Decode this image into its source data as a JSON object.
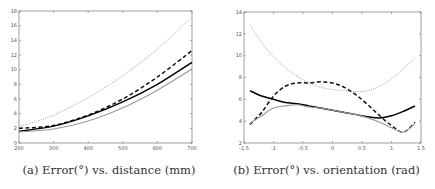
{
  "chart_data": [
    {
      "type": "line",
      "title": "",
      "caption": "(a) Error(°) vs. distance (mm)",
      "xlabel": "",
      "ylabel": "",
      "xlim": [
        200,
        700
      ],
      "ylim": [
        0,
        18
      ],
      "xticks": [
        200,
        300,
        400,
        500,
        600,
        700
      ],
      "yticks": [
        0,
        2,
        4,
        6,
        8,
        10,
        12,
        14,
        16,
        18
      ],
      "grid": false,
      "legend": null,
      "x": [
        200,
        300,
        400,
        500,
        600,
        700
      ],
      "series": [
        {
          "name": "dotted-gray",
          "style": "dotted",
          "color": "#888888",
          "values": [
            2.2,
            3.8,
            6.2,
            9.2,
            12.8,
            17.2
          ]
        },
        {
          "name": "dashed-black",
          "style": "dashed",
          "color": "#111111",
          "values": [
            2.0,
            2.4,
            3.8,
            6.0,
            9.0,
            12.6
          ]
        },
        {
          "name": "solid-black",
          "style": "solid",
          "color": "#000000",
          "values": [
            1.6,
            2.3,
            3.7,
            5.6,
            8.0,
            11.0
          ]
        },
        {
          "name": "solid-gray",
          "style": "solid",
          "color": "#999999",
          "values": [
            1.5,
            1.9,
            3.0,
            4.8,
            7.2,
            10.1
          ]
        }
      ]
    },
    {
      "type": "line",
      "title": "",
      "caption": "(b) Error(°) vs. orientation (rad)",
      "xlabel": "",
      "ylabel": "",
      "xlim": [
        -1.5,
        1.5
      ],
      "ylim": [
        2,
        14
      ],
      "xticks": [
        -1.5,
        -1,
        -0.5,
        0,
        0.5,
        1,
        1.5
      ],
      "yticks": [
        2,
        4,
        6,
        8,
        10,
        12,
        14
      ],
      "grid": false,
      "legend": null,
      "x": [
        -1.4,
        -1.2,
        -1.0,
        -0.8,
        -0.6,
        -0.4,
        -0.2,
        0,
        0.2,
        0.4,
        0.6,
        0.8,
        1.0,
        1.2,
        1.4
      ],
      "series": [
        {
          "name": "dotted-gray",
          "style": "dotted",
          "color": "#888888",
          "values": [
            12.8,
            11.2,
            9.9,
            8.9,
            8.1,
            7.5,
            7.1,
            6.9,
            6.8,
            6.7,
            6.8,
            7.2,
            7.9,
            8.8,
            9.8
          ]
        },
        {
          "name": "dashed-black",
          "style": "dashed",
          "color": "#111111",
          "values": [
            3.7,
            4.8,
            6.3,
            7.2,
            7.5,
            7.5,
            7.6,
            7.5,
            7.1,
            6.4,
            5.5,
            4.5,
            3.6,
            3.0,
            3.9
          ]
        },
        {
          "name": "solid-black",
          "style": "solid",
          "color": "#000000",
          "values": [
            6.8,
            6.3,
            6.0,
            5.7,
            5.6,
            5.4,
            5.2,
            5.0,
            4.8,
            4.6,
            4.4,
            4.3,
            4.5,
            4.9,
            5.4
          ]
        },
        {
          "name": "solid-gray",
          "style": "solid",
          "color": "#999999",
          "values": [
            3.8,
            4.5,
            5.2,
            5.4,
            5.5,
            5.3,
            5.2,
            5.0,
            4.8,
            4.6,
            4.3,
            3.9,
            3.4,
            3.0,
            3.8
          ]
        }
      ]
    }
  ],
  "captions": {
    "a": "(a) Error(°) vs. distance (mm)",
    "b": "(b) Error(°) vs. orientation (rad)"
  }
}
